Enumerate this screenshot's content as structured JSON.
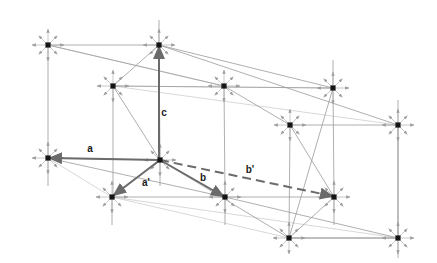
{
  "figure": {
    "kind": "crystal-lattice-vector-diagram",
    "width": 437,
    "height": 263,
    "background": "#ffffff"
  },
  "colors": {
    "node": "#141414",
    "lattice_line": "#9a9a9a",
    "thin_ray": "#b0b0b0",
    "vector": "#777777",
    "vector_dark": "#6b6b6b",
    "label": "#1a1a1a"
  },
  "origin": {
    "name": "origin-node",
    "x": 160,
    "y": 160
  },
  "nodes": [
    {
      "name": "node-top-left",
      "x": 48,
      "y": 45
    },
    {
      "name": "node-top-mid",
      "x": 159,
      "y": 45
    },
    {
      "name": "node-upper-mid-left",
      "x": 113,
      "y": 86
    },
    {
      "name": "node-upper-mid-right",
      "x": 224,
      "y": 86
    },
    {
      "name": "node-upper-right",
      "x": 333,
      "y": 88
    },
    {
      "name": "node-mid-right",
      "x": 290,
      "y": 125
    },
    {
      "name": "node-far-right",
      "x": 398,
      "y": 125
    },
    {
      "name": "node-left",
      "x": 48,
      "y": 158
    },
    {
      "name": "node-origin",
      "x": 160,
      "y": 160
    },
    {
      "name": "node-lower-left",
      "x": 112,
      "y": 197
    },
    {
      "name": "node-lower-mid",
      "x": 225,
      "y": 197
    },
    {
      "name": "node-lower-right",
      "x": 334,
      "y": 197
    },
    {
      "name": "node-bottom-mid",
      "x": 289,
      "y": 238
    },
    {
      "name": "node-bottom-right",
      "x": 398,
      "y": 238
    }
  ],
  "vectors": [
    {
      "name": "vector-a",
      "label": "a",
      "style": "solid",
      "from": {
        "x": 160,
        "y": 160
      },
      "to": {
        "x": 50,
        "y": 158
      },
      "label_pos": {
        "x": 90,
        "y": 152
      }
    },
    {
      "name": "vector-a-prime",
      "label": "a'",
      "style": "solid",
      "from": {
        "x": 160,
        "y": 160
      },
      "to": {
        "x": 114,
        "y": 195
      },
      "label_pos": {
        "x": 146,
        "y": 186
      }
    },
    {
      "name": "vector-b",
      "label": "b",
      "style": "solid",
      "from": {
        "x": 160,
        "y": 160
      },
      "to": {
        "x": 223,
        "y": 196
      },
      "label_pos": {
        "x": 203,
        "y": 181
      }
    },
    {
      "name": "vector-b-prime",
      "label": "b'",
      "style": "dashed",
      "from": {
        "x": 160,
        "y": 160
      },
      "to": {
        "x": 332,
        "y": 196
      },
      "label_pos": {
        "x": 250,
        "y": 173
      }
    },
    {
      "name": "vector-c",
      "label": "c",
      "style": "solid",
      "from": {
        "x": 159,
        "y": 158
      },
      "to": {
        "x": 159,
        "y": 47
      },
      "label_pos": {
        "x": 164,
        "y": 116
      }
    }
  ],
  "lattice_edges": [
    {
      "name": "edge-top-horizontal",
      "x1": 48,
      "y1": 45,
      "x2": 159,
      "y2": 45
    },
    {
      "name": "edge-upper-horizontal",
      "x1": 113,
      "y1": 86,
      "x2": 333,
      "y2": 88
    },
    {
      "name": "edge-mid-horizontal",
      "x1": 290,
      "y1": 125,
      "x2": 398,
      "y2": 125
    },
    {
      "name": "edge-left-horizontal",
      "x1": 48,
      "y1": 158,
      "x2": 160,
      "y2": 160
    },
    {
      "name": "edge-lower-horizontal",
      "x1": 112,
      "y1": 197,
      "x2": 334,
      "y2": 197
    },
    {
      "name": "edge-bottom-horizontal",
      "x1": 289,
      "y1": 238,
      "x2": 398,
      "y2": 238
    },
    {
      "name": "edge-vert-left-top",
      "x1": 48,
      "y1": 45,
      "x2": 48,
      "y2": 158
    },
    {
      "name": "edge-vert-left-bottom",
      "x1": 48,
      "y1": 158,
      "x2": 48,
      "y2": 186
    },
    {
      "name": "edge-vert-midleft",
      "x1": 113,
      "y1": 86,
      "x2": 113,
      "y2": 197
    },
    {
      "name": "edge-vert-midleft-low",
      "x1": 112,
      "y1": 197,
      "x2": 112,
      "y2": 225
    },
    {
      "name": "edge-vert-center-top",
      "x1": 159,
      "y1": 20,
      "x2": 159,
      "y2": 45
    },
    {
      "name": "edge-vert-center",
      "x1": 159,
      "y1": 45,
      "x2": 160,
      "y2": 160
    },
    {
      "name": "edge-vert-center-low",
      "x1": 160,
      "y1": 160,
      "x2": 160,
      "y2": 186
    },
    {
      "name": "edge-vert-upmidright",
      "x1": 224,
      "y1": 86,
      "x2": 225,
      "y2": 197
    },
    {
      "name": "edge-vert-lowmid-low",
      "x1": 225,
      "y1": 197,
      "x2": 225,
      "y2": 225
    },
    {
      "name": "edge-vert-midright",
      "x1": 290,
      "y1": 125,
      "x2": 289,
      "y2": 238
    },
    {
      "name": "edge-vert-upperright",
      "x1": 333,
      "y1": 60,
      "x2": 333,
      "y2": 88
    },
    {
      "name": "edge-vert-upright-low",
      "x1": 333,
      "y1": 88,
      "x2": 334,
      "y2": 197
    },
    {
      "name": "edge-vert-lowright-lo",
      "x1": 334,
      "y1": 197,
      "x2": 334,
      "y2": 225
    },
    {
      "name": "edge-vert-farright",
      "x1": 398,
      "y1": 100,
      "x2": 398,
      "y2": 125
    },
    {
      "name": "edge-vert-farright-lo",
      "x1": 398,
      "y1": 125,
      "x2": 398,
      "y2": 238
    },
    {
      "name": "edge-vert-botright-lo",
      "x1": 398,
      "y1": 238,
      "x2": 398,
      "y2": 258
    },
    {
      "name": "edge-diag-tl-ur",
      "x1": 48,
      "y1": 45,
      "x2": 224,
      "y2": 86
    },
    {
      "name": "edge-diag-tm-mr",
      "x1": 159,
      "y1": 45,
      "x2": 398,
      "y2": 125
    },
    {
      "name": "edge-diag-tm-upright",
      "x1": 159,
      "y1": 45,
      "x2": 333,
      "y2": 88
    },
    {
      "name": "edge-diag-uml-tm",
      "x1": 113,
      "y1": 86,
      "x2": 159,
      "y2": 45
    },
    {
      "name": "edge-diag-left-lowmid",
      "x1": 48,
      "y1": 158,
      "x2": 225,
      "y2": 197
    },
    {
      "name": "edge-diag-org-lowleft",
      "x1": 160,
      "y1": 160,
      "x2": 112,
      "y2": 197
    },
    {
      "name": "edge-diag-org-botmid",
      "x1": 160,
      "y1": 160,
      "x2": 289,
      "y2": 238
    },
    {
      "name": "edge-diag-upright-bm",
      "x1": 333,
      "y1": 88,
      "x2": 289,
      "y2": 238
    },
    {
      "name": "edge-diag-lowright-bm",
      "x1": 334,
      "y1": 197,
      "x2": 289,
      "y2": 238
    },
    {
      "name": "edge-diag-mr-lowright",
      "x1": 290,
      "y1": 125,
      "x2": 334,
      "y2": 197
    },
    {
      "name": "edge-diag-far-botright",
      "x1": 398,
      "y1": 125,
      "x2": 398,
      "y2": 238
    },
    {
      "name": "edge-diag-lowmid-br",
      "x1": 225,
      "y1": 197,
      "x2": 398,
      "y2": 238
    },
    {
      "name": "edge-diag-botmid-br",
      "x1": 289,
      "y1": 238,
      "x2": 398,
      "y2": 238
    },
    {
      "name": "edge-diag-upmr-upr",
      "x1": 224,
      "y1": 86,
      "x2": 290,
      "y2": 125
    },
    {
      "name": "edge-diag-uml-org",
      "x1": 113,
      "y1": 86,
      "x2": 160,
      "y2": 160
    }
  ],
  "thin_rays": [
    {
      "name": "ray-tl-to-upmidright",
      "x1": 48,
      "y1": 45,
      "x2": 224,
      "y2": 86
    },
    {
      "name": "ray-upmidleft-to-far",
      "x1": 113,
      "y1": 86,
      "x2": 398,
      "y2": 125
    },
    {
      "name": "ray-upmidleft-to-upr",
      "x1": 113,
      "y1": 86,
      "x2": 333,
      "y2": 88
    },
    {
      "name": "ray-lowleft-to-botmid",
      "x1": 112,
      "y1": 197,
      "x2": 289,
      "y2": 238
    },
    {
      "name": "ray-lowleft-to-botrt",
      "x1": 112,
      "y1": 197,
      "x2": 398,
      "y2": 238
    },
    {
      "name": "ray-left-to-lowleft",
      "x1": 48,
      "y1": 158,
      "x2": 112,
      "y2": 197
    }
  ],
  "star_arms": {
    "name": "node-star-rays",
    "description": "eight small arrows radiating from each lattice point",
    "count": 8,
    "length": 16
  },
  "labels": [
    {
      "name": "label-a",
      "text": "a"
    },
    {
      "name": "label-a-prime",
      "text": "a'"
    },
    {
      "name": "label-b",
      "text": "b"
    },
    {
      "name": "label-b-prime",
      "text": "b'"
    },
    {
      "name": "label-c",
      "text": "c"
    }
  ]
}
